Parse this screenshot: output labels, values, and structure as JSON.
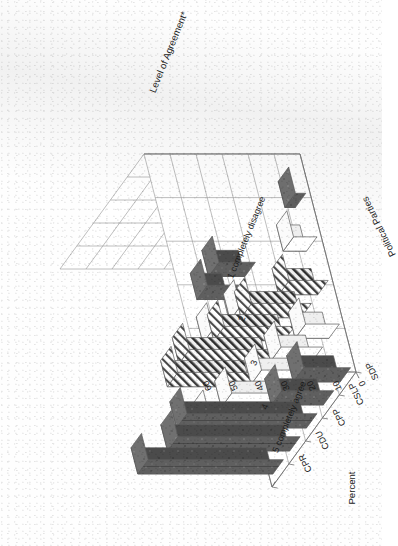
{
  "chart_data": {
    "type": "bar",
    "subtype": "3d-grouped-bar",
    "title": "",
    "xlabel": "Political Parties",
    "zlabel": "Level of Agreement*",
    "ylabel": "Percent",
    "ylim": [
      0,
      60
    ],
    "yticks": [
      "0",
      "10",
      "20",
      "30",
      "40",
      "50",
      "60"
    ],
    "grid": true,
    "legend": "none",
    "categories": [
      "SDP",
      "CSLP",
      "CPP",
      "CDU",
      "CPR"
    ],
    "depth_categories": [
      "1 completely disagree",
      "2",
      "3",
      "4",
      "5 completely agree"
    ],
    "series": [
      {
        "name": "1 completely disagree",
        "pattern": "dark",
        "values": [
          4,
          0,
          0,
          14,
          12
        ]
      },
      {
        "name": "2",
        "pattern": "white",
        "values": [
          9,
          0,
          0,
          10,
          14
        ]
      },
      {
        "name": "3",
        "pattern": "hatch",
        "values": [
          15,
          23,
          27,
          34,
          32
        ]
      },
      {
        "name": "4",
        "pattern": "white",
        "values": [
          13,
          16,
          17,
          22,
          24
        ]
      },
      {
        "name": "5 completely agree",
        "pattern": "dark",
        "values": [
          18,
          20,
          50,
          47,
          52
        ]
      }
    ],
    "patterns": {
      "dark": "#5d5d5d",
      "white": "#ffffff",
      "hatch": "diagonal-hatch"
    }
  },
  "axes": {
    "percent_label": "Percent",
    "parties_label": "Political Parties",
    "agreement_label": "Level of Agreement*",
    "percent_ticks": [
      "0",
      "10",
      "20",
      "30",
      "40",
      "50",
      "60"
    ],
    "party_ticks": [
      "SDP",
      "CSLP",
      "CPP",
      "CDU",
      "CPR"
    ],
    "agreement_ticks": [
      "5 completely agree",
      "4",
      "3",
      "2",
      "1 completely disagree"
    ]
  },
  "colors": {
    "axis": "#6f6f6f",
    "grid": "#9a9a9a",
    "bar_dark": "#5d5d5d",
    "bar_dark_top": "#6e6e6e",
    "bar_dark_side": "#4a4a4a",
    "bar_white": "#ffffff",
    "outline": "#5a5a5a",
    "text": "#1a1a1a",
    "background": "#ffffff"
  }
}
